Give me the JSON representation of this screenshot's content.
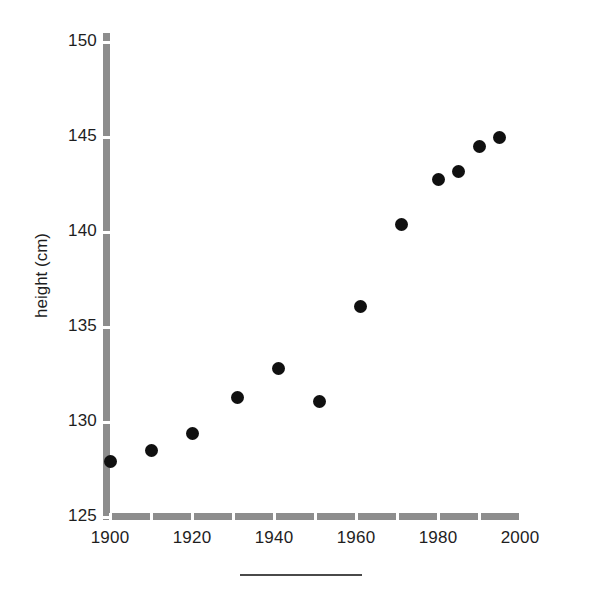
{
  "chart_data": {
    "type": "scatter",
    "title": "",
    "xlabel": "",
    "ylabel": "height (cm)",
    "xlim": [
      1900,
      2000
    ],
    "ylim": [
      125,
      150.5
    ],
    "grid": false,
    "legend": null,
    "marker": {
      "shape": "circle",
      "color": "#101010",
      "size_px": 13
    },
    "axis_color": "#8d8d8d",
    "x": [
      1900,
      1910,
      1920,
      1931,
      1941,
      1951,
      1961,
      1971,
      1980,
      1985,
      1990,
      1995
    ],
    "values": [
      127.9,
      128.5,
      129.4,
      131.3,
      132.8,
      131.1,
      136.1,
      140.4,
      142.8,
      143.2,
      144.5,
      145.0
    ],
    "points": [
      {
        "x": 1900,
        "y": 127.9
      },
      {
        "x": 1910,
        "y": 128.5
      },
      {
        "x": 1920,
        "y": 129.4
      },
      {
        "x": 1931,
        "y": 131.3
      },
      {
        "x": 1941,
        "y": 132.8
      },
      {
        "x": 1951,
        "y": 131.1
      },
      {
        "x": 1961,
        "y": 136.1
      },
      {
        "x": 1971,
        "y": 140.4
      },
      {
        "x": 1980,
        "y": 142.8
      },
      {
        "x": 1985,
        "y": 143.2
      },
      {
        "x": 1990,
        "y": 144.5
      },
      {
        "x": 1995,
        "y": 145.0
      }
    ],
    "y_ticks": [
      125,
      130,
      135,
      140,
      145,
      150
    ],
    "y_tick_labels": [
      "125",
      "130",
      "135",
      "140",
      "145",
      "150"
    ],
    "x_ticks": [
      1900,
      1910,
      1920,
      1930,
      1940,
      1950,
      1960,
      1970,
      1980,
      1990,
      2000
    ],
    "x_tick_labels_shown": [
      "1900",
      "1920",
      "1940",
      "1960",
      "1980",
      "2000"
    ],
    "x_labeled_ticks": [
      1900,
      1920,
      1940,
      1960,
      1980,
      2000
    ]
  },
  "figure": {
    "y_axis_title": "height (cm)",
    "caption_rule": ""
  }
}
